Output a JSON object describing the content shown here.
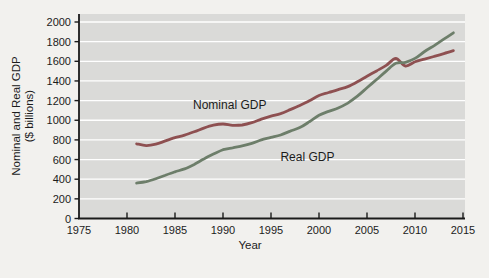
{
  "figure": {
    "background_color": "#f2f1ee",
    "panel_color": "#dadad8",
    "grid_color": "#ffffff",
    "axis_color": "#1a1a1a",
    "text_color": "#1c1c1c"
  },
  "chart_data": {
    "type": "line",
    "title": "",
    "xlabel": "Year",
    "ylabel_line1": "Nominal and Real GDP",
    "ylabel_line2": "($ billions)",
    "xlim": [
      1975,
      2015
    ],
    "ylim": [
      0,
      2000
    ],
    "xticks": [
      1975,
      1980,
      1985,
      1990,
      1995,
      2000,
      2005,
      2010,
      2015
    ],
    "yticks": [
      0,
      200,
      400,
      600,
      800,
      1000,
      1200,
      1400,
      1600,
      1800,
      2000
    ],
    "grid": "horizontal-white-on-gray-panel",
    "legend_position": "inline-labels-on-lines",
    "x": [
      1981,
      1982,
      1983,
      1984,
      1985,
      1986,
      1987,
      1988,
      1989,
      1990,
      1991,
      1992,
      1993,
      1994,
      1995,
      1996,
      1997,
      1998,
      1999,
      2000,
      2001,
      2002,
      2003,
      2004,
      2005,
      2006,
      2007,
      2008,
      2009,
      2010,
      2011,
      2012,
      2013,
      2014
    ],
    "series": [
      {
        "name": "Nominal GDP",
        "color": "#8e5051",
        "values": [
          760,
          742,
          756,
          790,
          822,
          848,
          882,
          920,
          950,
          962,
          948,
          952,
          975,
          1012,
          1042,
          1068,
          1108,
          1150,
          1198,
          1252,
          1282,
          1312,
          1342,
          1392,
          1448,
          1502,
          1558,
          1628,
          1552,
          1595,
          1622,
          1650,
          1678,
          1708
        ],
        "label_pos": {
          "year": 1990.7,
          "value": 1115
        }
      },
      {
        "name": "Real GDP",
        "color": "#6d7e6a",
        "values": [
          360,
          375,
          405,
          440,
          475,
          505,
          550,
          605,
          655,
          700,
          720,
          740,
          765,
          800,
          825,
          850,
          890,
          925,
          985,
          1050,
          1090,
          1125,
          1175,
          1245,
          1330,
          1415,
          1500,
          1580,
          1590,
          1630,
          1700,
          1760,
          1825,
          1890
        ],
        "label_pos": {
          "year": 1998.8,
          "value": 590
        }
      }
    ]
  }
}
